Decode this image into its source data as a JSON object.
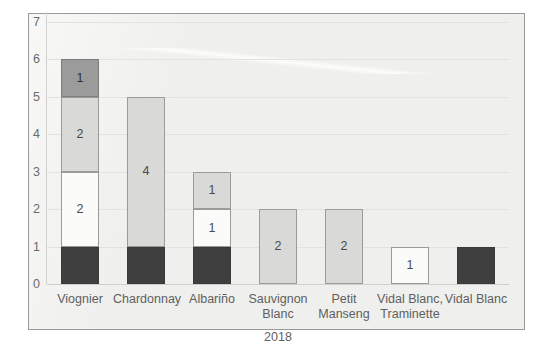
{
  "chart_data": {
    "type": "bar",
    "title": "",
    "subtitle": "",
    "xlabel": "2018",
    "ylabel": "",
    "ylim": [
      0,
      7
    ],
    "yticks": [
      0,
      1,
      2,
      3,
      4,
      5,
      6,
      7
    ],
    "grid": true,
    "legend": "none",
    "stacked": true,
    "categories": [
      "Viognier",
      "Chardonnay",
      "Albariño",
      "Sauvignon Blanc",
      "Petit Manseng",
      "Vidal Blanc, Traminette",
      "Vidal Blanc"
    ],
    "series": [
      {
        "name": "dark",
        "color": "#3f3f3f",
        "values": [
          1,
          1,
          1,
          0,
          0,
          0,
          1
        ]
      },
      {
        "name": "white",
        "color": "#fbfbfa",
        "values": [
          2,
          0,
          1,
          0,
          0,
          0,
          0
        ]
      },
      {
        "name": "light-gray",
        "color": "#d9d9d7",
        "values": [
          2,
          4,
          1,
          2,
          2,
          1,
          0
        ]
      },
      {
        "name": "dark-gray",
        "color": "#9b9b9b",
        "values": [
          1,
          0,
          0,
          0,
          0,
          0,
          0
        ]
      }
    ],
    "totals": [
      6,
      5,
      3,
      2,
      2,
      1,
      1
    ],
    "bars": [
      {
        "category": "Viognier",
        "total": 6,
        "segments": [
          {
            "style": "dark",
            "from": 0,
            "to": 1,
            "value": 1,
            "label": ""
          },
          {
            "style": "white",
            "from": 1,
            "to": 3,
            "value": 2,
            "label": "2"
          },
          {
            "style": "lightgray",
            "from": 3,
            "to": 5,
            "value": 2,
            "label": "2"
          },
          {
            "style": "darkgray",
            "from": 5,
            "to": 6,
            "value": 1,
            "label": "1"
          }
        ]
      },
      {
        "category": "Chardonnay",
        "total": 5,
        "segments": [
          {
            "style": "dark",
            "from": 0,
            "to": 1,
            "value": 1,
            "label": ""
          },
          {
            "style": "lightgray",
            "from": 1,
            "to": 5,
            "value": 4,
            "label": "4"
          }
        ]
      },
      {
        "category": "Albariño",
        "total": 3,
        "segments": [
          {
            "style": "dark",
            "from": 0,
            "to": 1,
            "value": 1,
            "label": ""
          },
          {
            "style": "white",
            "from": 1,
            "to": 2,
            "value": 1,
            "label": "1"
          },
          {
            "style": "lightgray",
            "from": 2,
            "to": 3,
            "value": 1,
            "label": "1"
          }
        ]
      },
      {
        "category": "Sauvignon Blanc",
        "total": 2,
        "segments": [
          {
            "style": "lightgray",
            "from": 0,
            "to": 2,
            "value": 2,
            "label": "2"
          }
        ]
      },
      {
        "category": "Petit Manseng",
        "total": 2,
        "segments": [
          {
            "style": "lightgray",
            "from": 0,
            "to": 2,
            "value": 2,
            "label": "2"
          }
        ]
      },
      {
        "category": "Vidal Blanc, Traminette",
        "total": 1,
        "segments": [
          {
            "style": "white",
            "from": 0,
            "to": 1,
            "value": 1,
            "label": "1"
          }
        ]
      },
      {
        "category": "Vidal Blanc",
        "total": 1,
        "segments": [
          {
            "style": "dark",
            "from": 0,
            "to": 1,
            "value": 1,
            "label": ""
          }
        ]
      }
    ]
  },
  "axis": {
    "y_tick_labels": [
      "7",
      "6",
      "5",
      "4",
      "3",
      "2",
      "1",
      "0"
    ],
    "x_title": "2018"
  },
  "category_label_lines": [
    [
      "Viognier"
    ],
    [
      "Chardonnay"
    ],
    [
      "Albariño"
    ],
    [
      "Sauvignon",
      "Blanc"
    ],
    [
      "Petit",
      "Manseng"
    ],
    [
      "Vidal Blanc,",
      "Traminette"
    ],
    [
      "Vidal Blanc"
    ]
  ]
}
